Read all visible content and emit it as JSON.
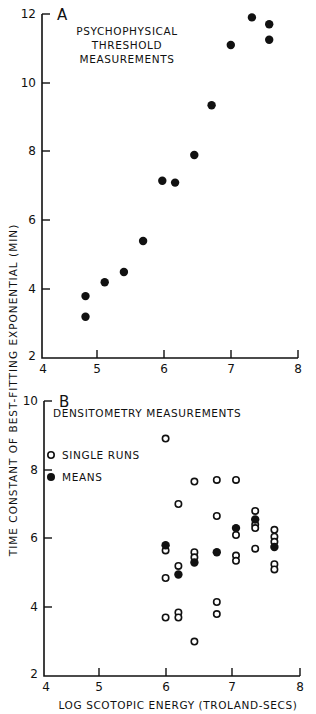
{
  "chart_data": [
    {
      "type": "scatter",
      "panel": "A",
      "title": "PSYCHOPHYSICAL THRESHOLD MEASUREMENTS",
      "title_lines": [
        "PSYCHOPHYSICAL",
        "THRESHOLD",
        "MEASUREMENTS"
      ],
      "xlabel": "",
      "ylabel": "TIME CONSTANT OF BEST-FITTING EXPONENTIAL (MIN)",
      "xlim": [
        4,
        8
      ],
      "ylim": [
        2,
        12
      ],
      "xticks": [
        4,
        5,
        6,
        7,
        8
      ],
      "yticks": [
        2,
        4,
        6,
        8,
        10,
        12
      ],
      "grid": false,
      "series": [
        {
          "name": "Psychophysical threshold",
          "marker": "filled",
          "x": [
            4.68,
            4.68,
            4.98,
            5.28,
            5.58,
            5.88,
            6.08,
            6.38,
            6.65,
            6.95,
            7.28,
            7.55,
            7.55
          ],
          "y": [
            3.8,
            3.2,
            4.2,
            4.5,
            5.4,
            7.15,
            7.1,
            7.9,
            9.35,
            11.1,
            11.9,
            11.7,
            11.25
          ]
        }
      ]
    },
    {
      "type": "scatter",
      "panel": "B",
      "title": "DENSITOMETRY MEASUREMENTS",
      "xlabel": "LOG SCOTOPIC ENERGY (TROLAND-SECS)",
      "ylabel": "TIME CONSTANT OF BEST-FITTING EXPONENTIAL (MIN)",
      "xlim": [
        4,
        8
      ],
      "ylim": [
        2,
        10
      ],
      "xticks": [
        4,
        5,
        6,
        7,
        8
      ],
      "yticks": [
        2,
        4,
        6,
        8,
        10
      ],
      "grid": false,
      "legend": [
        {
          "label": "SINGLE RUNS",
          "marker": "open"
        },
        {
          "label": "MEANS",
          "marker": "filled"
        }
      ],
      "legend_position": "upper left",
      "series": [
        {
          "name": "SINGLE RUNS",
          "marker": "open",
          "x": [
            5.9,
            5.9,
            5.9,
            5.9,
            6.1,
            6.1,
            6.1,
            6.1,
            6.35,
            6.35,
            6.35,
            6.35,
            6.7,
            6.7,
            6.7,
            6.7,
            7.0,
            7.0,
            7.0,
            7.0,
            7.3,
            7.3,
            7.3,
            7.3,
            7.6,
            7.6,
            7.6,
            7.6,
            7.6
          ],
          "y": [
            8.9,
            5.65,
            4.85,
            3.7,
            7.0,
            5.2,
            3.85,
            3.7,
            7.65,
            5.6,
            5.45,
            3.0,
            7.7,
            6.65,
            4.15,
            3.8,
            7.7,
            6.1,
            5.5,
            5.35,
            6.8,
            6.4,
            6.3,
            5.7,
            6.25,
            6.05,
            5.9,
            5.25,
            5.1
          ]
        },
        {
          "name": "MEANS",
          "marker": "filled",
          "x": [
            5.9,
            6.1,
            6.35,
            6.7,
            7.0,
            7.3,
            7.6
          ],
          "y": [
            5.8,
            4.95,
            5.3,
            5.6,
            6.3,
            6.55,
            5.75
          ]
        }
      ]
    }
  ],
  "panels": {
    "a": {
      "letter": "A",
      "title_line1": "PSYCHOPHYSICAL",
      "title_line2": "THRESHOLD",
      "title_line3": "MEASUREMENTS",
      "yticks": [
        "12",
        "10",
        "8",
        "6",
        "4",
        "2"
      ],
      "xticks": [
        "4",
        "5",
        "6",
        "7",
        "8"
      ]
    },
    "b": {
      "letter": "B",
      "title": "DENSITOMETRY MEASUREMENTS",
      "legend_open": "SINGLE RUNS",
      "legend_filled": "MEANS",
      "yticks": [
        "10",
        "8",
        "6",
        "4",
        "2"
      ],
      "xticks": [
        "4",
        "5",
        "6",
        "7",
        "8"
      ],
      "xlabel": "LOG SCOTOPIC ENERGY (TROLAND-SECS)"
    }
  },
  "shared_ylabel": "TIME CONSTANT OF BEST-FITTING EXPONENTIAL (MIN)"
}
